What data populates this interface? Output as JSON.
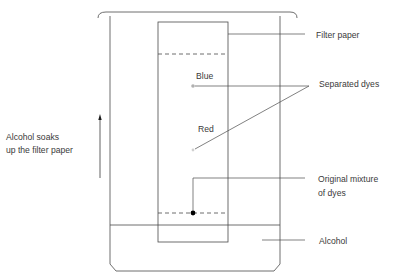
{
  "diagram": {
    "type": "paper-chromatography",
    "labels": {
      "filter_paper": "Filter paper",
      "separated_dyes": "Separated dyes",
      "original_mixture_line1": "Original mixture",
      "original_mixture_line2": "of dyes",
      "alcohol": "Alcohol",
      "soak_line1": "Alcohol soaks",
      "soak_line2": "up the filter paper",
      "blue": "Blue",
      "red": "Red"
    },
    "colors": {
      "stroke": "#3a3a3a",
      "text": "#3a3a3a",
      "blue_dot": "#b0b0b0",
      "red_dot": "#d0d0d0",
      "mixture_dot": "#000000"
    }
  }
}
